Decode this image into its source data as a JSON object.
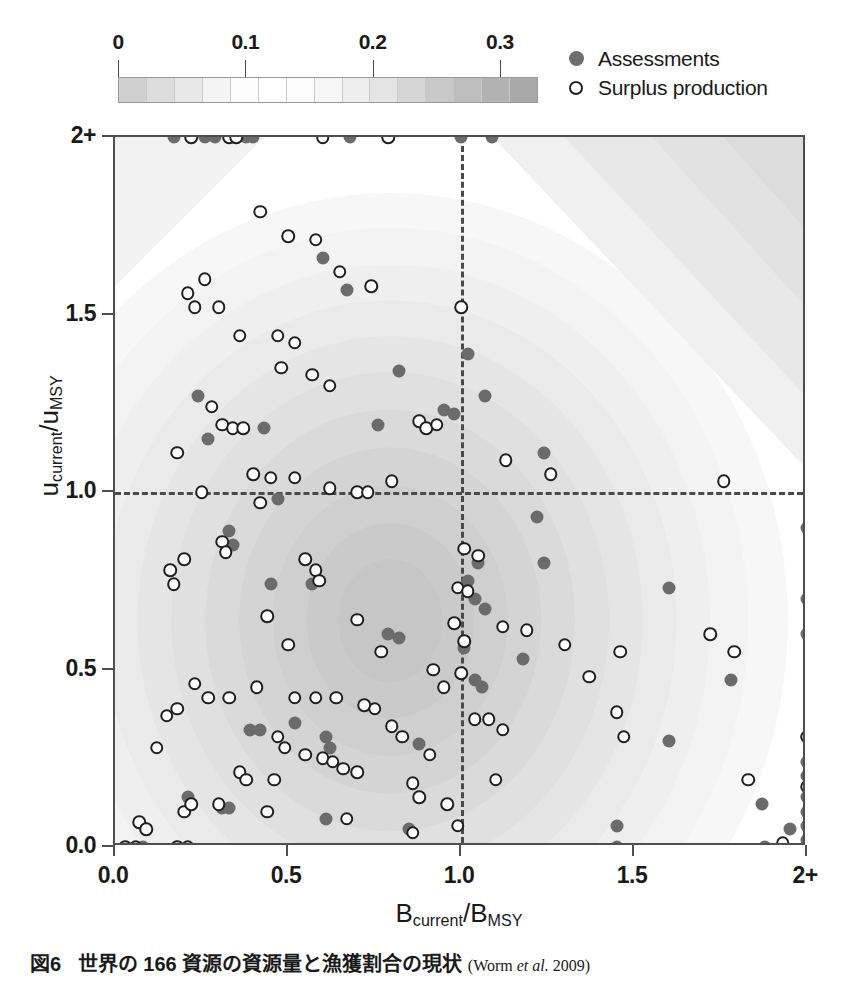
{
  "figure": {
    "caption_number": "図6",
    "caption_text": "世界の 166 資源の資源量と漁獲割合の現状",
    "caption_source_open": "(Worm ",
    "caption_source_italic": "et al.",
    "caption_source_close": " 2009)"
  },
  "colorbar": {
    "tick_labels": [
      "0",
      "0.1",
      "0.2",
      "0.3"
    ],
    "tick_values": [
      0,
      0.1,
      0.2,
      0.3
    ],
    "range": [
      0,
      0.33
    ],
    "n_segments": 15,
    "segment_colors": [
      "#d0d0d0",
      "#dcdcdc",
      "#e8e8e8",
      "#f4f4f4",
      "#fdfdfd",
      "#ffffff",
      "#fcfcfc",
      "#f6f6f6",
      "#eeeeee",
      "#e4e4e4",
      "#d6d6d6",
      "#c8c8c8",
      "#bdbdbd",
      "#b2b2b2",
      "#a8a8a8"
    ]
  },
  "legend": {
    "position": "top-right",
    "items": [
      {
        "label": "Assessments",
        "marker": "filled-circle",
        "color": "#6e6e6e"
      },
      {
        "label": "Surplus production",
        "marker": "open-circle",
        "color": "#ffffff"
      }
    ]
  },
  "chart_data": {
    "type": "scatter",
    "title": "",
    "xlabel": "B_current / B_MSY",
    "ylabel": "u_current / u_MSY",
    "xlabel_parts": {
      "base1": "B",
      "sub1": "current",
      "slash": "/",
      "base2": "B",
      "sub2": "MSY"
    },
    "ylabel_parts": {
      "base1": "u",
      "sub1": "current",
      "slash": "/",
      "base2": "u",
      "sub2": "MSY"
    },
    "xlim": [
      0.0,
      2.0
    ],
    "ylim": [
      0.0,
      2.0
    ],
    "xticks": [
      0.0,
      0.5,
      1.0,
      1.5,
      2.0
    ],
    "xtick_labels": [
      "0.0",
      "0.5",
      "1.0",
      "1.5",
      "2+"
    ],
    "yticks": [
      0.0,
      0.5,
      1.0,
      1.5,
      2.0
    ],
    "ytick_labels": [
      "0.0",
      "0.5",
      "1.0",
      "1.5",
      "2+"
    ],
    "grid": false,
    "reference_lines": [
      {
        "orientation": "vertical",
        "value": 1.0,
        "style": "dashed"
      },
      {
        "orientation": "horizontal",
        "value": 1.0,
        "style": "dashed"
      }
    ],
    "colorbar_label": "kernel density",
    "n_stocks": 166,
    "series": [
      {
        "name": "Assessments",
        "marker": "filled-circle",
        "points": [
          [
            0.17,
            2.0
          ],
          [
            0.26,
            2.0
          ],
          [
            0.29,
            2.0
          ],
          [
            0.38,
            2.0
          ],
          [
            0.4,
            2.0
          ],
          [
            0.68,
            2.0
          ],
          [
            1.0,
            2.0
          ],
          [
            1.09,
            2.0
          ],
          [
            0.6,
            1.66
          ],
          [
            0.67,
            1.57
          ],
          [
            1.02,
            1.39
          ],
          [
            0.82,
            1.34
          ],
          [
            1.07,
            1.27
          ],
          [
            0.24,
            1.27
          ],
          [
            0.27,
            1.15
          ],
          [
            0.95,
            1.23
          ],
          [
            0.98,
            1.22
          ],
          [
            0.76,
            1.19
          ],
          [
            0.43,
            1.18
          ],
          [
            1.24,
            1.11
          ],
          [
            0.47,
            0.98
          ],
          [
            0.33,
            0.89
          ],
          [
            0.34,
            0.85
          ],
          [
            1.22,
            0.93
          ],
          [
            1.24,
            0.8
          ],
          [
            1.05,
            0.8
          ],
          [
            1.02,
            0.75
          ],
          [
            1.04,
            0.7
          ],
          [
            1.07,
            0.67
          ],
          [
            0.79,
            0.6
          ],
          [
            0.82,
            0.59
          ],
          [
            1.01,
            0.56
          ],
          [
            1.18,
            0.53
          ],
          [
            0.57,
            0.74
          ],
          [
            0.45,
            0.74
          ],
          [
            1.04,
            0.47
          ],
          [
            1.06,
            0.45
          ],
          [
            0.39,
            0.33
          ],
          [
            0.42,
            0.33
          ],
          [
            0.52,
            0.35
          ],
          [
            0.61,
            0.31
          ],
          [
            0.62,
            0.28
          ],
          [
            0.88,
            0.29
          ],
          [
            0.61,
            0.08
          ],
          [
            0.85,
            0.05
          ],
          [
            0.31,
            0.11
          ],
          [
            0.33,
            0.11
          ],
          [
            0.21,
            0.14
          ],
          [
            0.08,
            0.0
          ],
          [
            1.45,
            0.0
          ],
          [
            1.88,
            0.0
          ],
          [
            1.6,
            0.3
          ],
          [
            1.6,
            0.73
          ],
          [
            1.45,
            0.06
          ],
          [
            1.78,
            0.47
          ],
          [
            1.87,
            0.12
          ],
          [
            1.95,
            0.05
          ],
          [
            2.0,
            0.9
          ],
          [
            2.0,
            0.7
          ],
          [
            2.0,
            0.6
          ],
          [
            2.0,
            0.31
          ],
          [
            2.0,
            0.24
          ],
          [
            2.0,
            0.2
          ],
          [
            2.0,
            0.14
          ],
          [
            2.0,
            0.1
          ],
          [
            2.0,
            0.06
          ],
          [
            2.0,
            0.02
          ]
        ]
      },
      {
        "name": "Surplus production",
        "marker": "open-circle",
        "points": [
          [
            0.22,
            2.0
          ],
          [
            0.33,
            2.0
          ],
          [
            0.35,
            2.0
          ],
          [
            0.6,
            2.0
          ],
          [
            0.79,
            2.0
          ],
          [
            0.42,
            1.79
          ],
          [
            0.5,
            1.72
          ],
          [
            0.58,
            1.71
          ],
          [
            0.65,
            1.62
          ],
          [
            0.26,
            1.6
          ],
          [
            0.21,
            1.56
          ],
          [
            0.23,
            1.52
          ],
          [
            0.3,
            1.52
          ],
          [
            0.74,
            1.58
          ],
          [
            1.0,
            1.52
          ],
          [
            0.36,
            1.44
          ],
          [
            0.47,
            1.44
          ],
          [
            0.52,
            1.42
          ],
          [
            0.48,
            1.35
          ],
          [
            0.57,
            1.33
          ],
          [
            0.62,
            1.3
          ],
          [
            0.28,
            1.24
          ],
          [
            0.31,
            1.19
          ],
          [
            0.34,
            1.18
          ],
          [
            0.37,
            1.18
          ],
          [
            0.18,
            1.11
          ],
          [
            0.4,
            1.05
          ],
          [
            0.45,
            1.04
          ],
          [
            0.52,
            1.04
          ],
          [
            0.88,
            1.2
          ],
          [
            0.9,
            1.18
          ],
          [
            0.93,
            1.19
          ],
          [
            1.13,
            1.09
          ],
          [
            1.26,
            1.05
          ],
          [
            1.76,
            1.03
          ],
          [
            0.25,
            1.0
          ],
          [
            0.62,
            1.01
          ],
          [
            0.7,
            1.0
          ],
          [
            0.73,
            1.0
          ],
          [
            0.8,
            1.03
          ],
          [
            0.42,
            0.97
          ],
          [
            0.2,
            0.81
          ],
          [
            0.31,
            0.86
          ],
          [
            0.32,
            0.83
          ],
          [
            0.55,
            0.81
          ],
          [
            0.58,
            0.78
          ],
          [
            0.59,
            0.75
          ],
          [
            1.01,
            0.84
          ],
          [
            1.05,
            0.82
          ],
          [
            0.99,
            0.73
          ],
          [
            1.02,
            0.72
          ],
          [
            0.98,
            0.63
          ],
          [
            1.01,
            0.58
          ],
          [
            1.12,
            0.62
          ],
          [
            1.19,
            0.61
          ],
          [
            1.3,
            0.57
          ],
          [
            1.46,
            0.55
          ],
          [
            1.72,
            0.6
          ],
          [
            1.79,
            0.55
          ],
          [
            0.17,
            0.74
          ],
          [
            0.16,
            0.78
          ],
          [
            0.44,
            0.65
          ],
          [
            0.7,
            0.64
          ],
          [
            0.5,
            0.57
          ],
          [
            0.77,
            0.55
          ],
          [
            0.23,
            0.46
          ],
          [
            0.27,
            0.42
          ],
          [
            0.33,
            0.42
          ],
          [
            0.18,
            0.39
          ],
          [
            0.12,
            0.28
          ],
          [
            0.15,
            0.37
          ],
          [
            0.41,
            0.45
          ],
          [
            0.52,
            0.42
          ],
          [
            0.58,
            0.42
          ],
          [
            0.64,
            0.42
          ],
          [
            0.72,
            0.4
          ],
          [
            0.75,
            0.39
          ],
          [
            0.92,
            0.5
          ],
          [
            0.95,
            0.45
          ],
          [
            1.0,
            0.49
          ],
          [
            1.04,
            0.36
          ],
          [
            1.08,
            0.36
          ],
          [
            1.12,
            0.33
          ],
          [
            1.37,
            0.48
          ],
          [
            1.45,
            0.38
          ],
          [
            1.47,
            0.31
          ],
          [
            1.83,
            0.19
          ],
          [
            1.93,
            0.01
          ],
          [
            2.0,
            0.31
          ],
          [
            2.0,
            0.17
          ],
          [
            0.47,
            0.31
          ],
          [
            0.49,
            0.28
          ],
          [
            0.55,
            0.26
          ],
          [
            0.6,
            0.25
          ],
          [
            0.63,
            0.24
          ],
          [
            0.66,
            0.22
          ],
          [
            0.7,
            0.21
          ],
          [
            0.86,
            0.18
          ],
          [
            0.88,
            0.14
          ],
          [
            0.91,
            0.26
          ],
          [
            0.96,
            0.12
          ],
          [
            1.1,
            0.19
          ],
          [
            0.36,
            0.21
          ],
          [
            0.38,
            0.19
          ],
          [
            0.3,
            0.12
          ],
          [
            0.2,
            0.1
          ],
          [
            0.22,
            0.12
          ],
          [
            0.07,
            0.07
          ],
          [
            0.09,
            0.05
          ],
          [
            0.03,
            0.0
          ],
          [
            0.06,
            0.0
          ],
          [
            0.18,
            0.0
          ],
          [
            0.21,
            0.0
          ],
          [
            0.86,
            0.04
          ],
          [
            0.99,
            0.06
          ],
          [
            0.44,
            0.1
          ],
          [
            0.67,
            0.08
          ],
          [
            0.8,
            0.34
          ],
          [
            0.83,
            0.31
          ],
          [
            0.46,
            0.19
          ]
        ]
      }
    ],
    "density": {
      "description": "2D kernel density contours of stock status, peak near B/Bmsy=0.80, u/umsy=0.63",
      "peak_x": 0.8,
      "peak_y": 0.63,
      "levels": [
        0.02,
        0.05,
        0.08,
        0.11,
        0.14,
        0.17,
        0.2,
        0.23,
        0.26,
        0.29
      ]
    }
  }
}
